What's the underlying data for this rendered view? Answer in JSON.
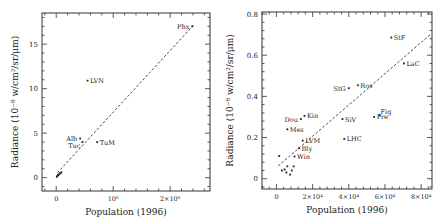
{
  "chart_data": [
    {
      "type": "scatter",
      "title": "",
      "xlabel": "Population (1996)",
      "ylabel": "Radiance (10⁻⁸ w/cm²/sr/μm)",
      "xlim": [
        -250000,
        2700000
      ],
      "ylim": [
        -1.5,
        18.5
      ],
      "xticks": [
        {
          "value": 0,
          "label": "0"
        },
        {
          "value": 1000000,
          "label": "10⁶"
        },
        {
          "value": 2000000,
          "label": "2×10⁶"
        }
      ],
      "yticks": [
        {
          "value": 0,
          "label": "0"
        },
        {
          "value": 5,
          "label": "5"
        },
        {
          "value": 10,
          "label": "10"
        },
        {
          "value": 15,
          "label": "15"
        }
      ],
      "grid": false,
      "points": [
        {
          "label": "Phx",
          "x": 2390000,
          "y": 17.0,
          "label_pos": "left"
        },
        {
          "label": "LVN",
          "x": 550000,
          "y": 10.9,
          "label_pos": "right"
        },
        {
          "label": "Alb",
          "x": 420000,
          "y": 4.4,
          "label_pos": "left"
        },
        {
          "label": "Tuc",
          "x": 460000,
          "y": 4.0,
          "label_pos": "left-below"
        },
        {
          "label": "TuM",
          "x": 720000,
          "y": 4.0,
          "label_pos": "right"
        },
        {
          "label": "",
          "x": 10000,
          "y": 0.1
        },
        {
          "label": "",
          "x": 20000,
          "y": 0.2
        },
        {
          "label": "",
          "x": 30000,
          "y": 0.3
        },
        {
          "label": "",
          "x": 45000,
          "y": 0.35
        },
        {
          "label": "",
          "x": 60000,
          "y": 0.45
        },
        {
          "label": "",
          "x": 75000,
          "y": 0.5
        },
        {
          "label": "",
          "x": 90000,
          "y": 0.6
        }
      ],
      "fit_line": {
        "style": "dashed",
        "x": [
          20000,
          2420000
        ],
        "y": [
          0.55,
          17.2
        ]
      }
    },
    {
      "type": "scatter",
      "title": "",
      "xlabel": "Population (1996)",
      "ylabel": "Radiance (10⁻⁸ w/cm²/sr/μm)",
      "xlim": [
        -8000,
        86000
      ],
      "ylim": [
        -0.05,
        0.81
      ],
      "xticks": [
        {
          "value": 0,
          "label": "0"
        },
        {
          "value": 20000,
          "label": "2×10⁴"
        },
        {
          "value": 40000,
          "label": "4×10⁴"
        },
        {
          "value": 60000,
          "label": "6×10⁴"
        },
        {
          "value": 80000,
          "label": "8×10⁴"
        }
      ],
      "yticks": [
        {
          "value": 0,
          "label": "0"
        },
        {
          "value": 0.2,
          "label": "0.2"
        },
        {
          "value": 0.4,
          "label": "0.4"
        },
        {
          "value": 0.6,
          "label": "0.6"
        },
        {
          "value": 0.8,
          "label": "0.8"
        }
      ],
      "grid": false,
      "points": [
        {
          "label": "StF",
          "x": 63500,
          "y": 0.686,
          "label_pos": "right"
        },
        {
          "label": "LaC",
          "x": 70500,
          "y": 0.56,
          "label_pos": "right"
        },
        {
          "label": "StG",
          "x": 40000,
          "y": 0.44,
          "label_pos": "left"
        },
        {
          "label": "Ros",
          "x": 45000,
          "y": 0.454,
          "label_pos": "right"
        },
        {
          "label": "Fig",
          "x": 57000,
          "y": 0.31,
          "label_pos": "right-above"
        },
        {
          "label": "Pre",
          "x": 54000,
          "y": 0.3,
          "label_pos": "right"
        },
        {
          "label": "SiV",
          "x": 36500,
          "y": 0.29,
          "label_pos": "right"
        },
        {
          "label": "LHC",
          "x": 37500,
          "y": 0.193,
          "label_pos": "right"
        },
        {
          "label": "Kin",
          "x": 15500,
          "y": 0.305,
          "label_pos": "right"
        },
        {
          "label": "Dou",
          "x": 13500,
          "y": 0.29,
          "label_pos": "left"
        },
        {
          "label": "Mes",
          "x": 6000,
          "y": 0.24,
          "label_pos": "right"
        },
        {
          "label": "LVM",
          "x": 14500,
          "y": 0.185,
          "label_pos": "right"
        },
        {
          "label": "Bly",
          "x": 12500,
          "y": 0.148,
          "label_pos": "right"
        },
        {
          "label": "Win",
          "x": 10000,
          "y": 0.108,
          "label_pos": "right"
        },
        {
          "label": "",
          "x": 1500,
          "y": 0.11
        },
        {
          "label": "",
          "x": 3000,
          "y": 0.04
        },
        {
          "label": "",
          "x": 4500,
          "y": 0.045
        },
        {
          "label": "",
          "x": 6000,
          "y": 0.06
        },
        {
          "label": "",
          "x": 7500,
          "y": 0.02
        },
        {
          "label": "",
          "x": 8500,
          "y": 0.04
        },
        {
          "label": "",
          "x": 9500,
          "y": 0.06
        },
        {
          "label": "",
          "x": 5500,
          "y": 0.03
        }
      ],
      "fit_line": {
        "style": "dashed",
        "x": [
          1000,
          85000
        ],
        "y": [
          0.062,
          0.7
        ]
      }
    }
  ],
  "charts": {
    "left": {
      "xlabel": "Population (1996)",
      "ylabel": "Radiance (10⁻⁸ w/cm²/sr/μm)"
    },
    "right": {
      "xlabel": "Population (1996)",
      "ylabel": "Radiance (10⁻⁸ w/cm²/sr/μm)"
    }
  }
}
